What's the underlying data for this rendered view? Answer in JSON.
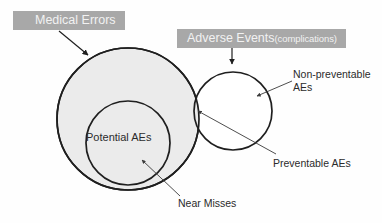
{
  "figure": {
    "title_banners": [
      {
        "id": "medical-errors",
        "text": "Medical Errors",
        "background_color": "#a8a8a8",
        "text_color": "#f2f2f2"
      },
      {
        "id": "adverse-events",
        "text_main": "Adverse Events",
        "text_sub": "(complications)",
        "background_color": "#a8a8a8",
        "text_color": "#f2f2f2"
      }
    ],
    "sets": [
      {
        "id": "medical-errors-set",
        "label": "Medical Errors",
        "shape": "circle",
        "cx": 128,
        "cy": 119,
        "r": 71,
        "fill": "#ebebeb",
        "stroke": "#1f1f1f"
      },
      {
        "id": "potential-aes-set",
        "label": "Potential AEs",
        "shape": "circle",
        "cx": 128,
        "cy": 143,
        "r": 42,
        "fill": "#ebebeb",
        "stroke": "#1f1f1f"
      },
      {
        "id": "adverse-events-set",
        "label": "Adverse Events (complications)",
        "shape": "circle",
        "cx": 233,
        "cy": 111,
        "r": 39,
        "fill": "none",
        "stroke": "#1f1f1f"
      }
    ],
    "inner_labels": [
      {
        "id": "potential-aes",
        "text": "Potential AEs"
      }
    ],
    "callouts": [
      {
        "id": "non-preventable-aes",
        "line1": "Non-preventable",
        "line2": "AEs",
        "points_to": "adverse-events-set-right-lobe"
      },
      {
        "id": "preventable-aes",
        "text": "Preventable AEs",
        "points_to": "overlap-region"
      },
      {
        "id": "near-misses",
        "text": "Near Misses",
        "points_to": "potential-aes-set"
      }
    ],
    "colors": {
      "background": "#fefefe",
      "set_fill_gray": "#ebebeb",
      "stroke": "#1f1f1f",
      "banner_gray": "#a8a8a8",
      "banner_text": "#f2f2f2",
      "text": "#2b2b2b",
      "leader_line": "#555555"
    }
  }
}
